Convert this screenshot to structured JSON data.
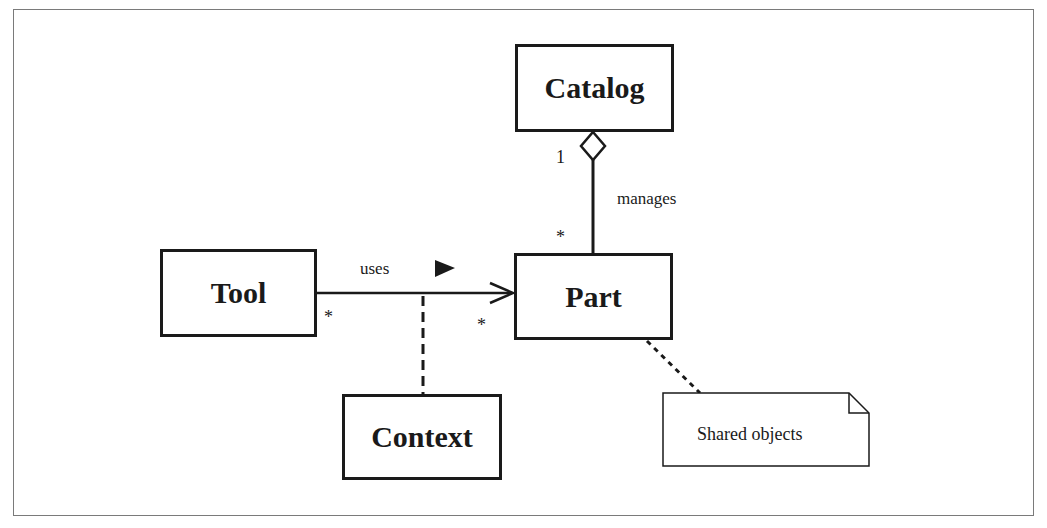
{
  "diagram": {
    "type": "UML class diagram",
    "classes": [
      {
        "id": "catalog",
        "name": "Catalog"
      },
      {
        "id": "tool",
        "name": "Tool"
      },
      {
        "id": "part",
        "name": "Part"
      },
      {
        "id": "context",
        "name": "Context"
      }
    ],
    "relationships": [
      {
        "id": "manages",
        "type": "aggregation",
        "from": "catalog",
        "to": "part",
        "label": "manages",
        "from_multiplicity": "1",
        "to_multiplicity": "*"
      },
      {
        "id": "uses",
        "type": "directed-association",
        "from": "tool",
        "to": "part",
        "label": "uses",
        "direction_marker": "▶",
        "from_multiplicity": "*",
        "to_multiplicity": "*",
        "association_class": "context"
      }
    ],
    "notes": [
      {
        "id": "shared-note",
        "text": "Shared objects",
        "attached_to": "part"
      }
    ],
    "colors": {
      "line": "#1a1a1a",
      "frame": "#7a7a7a",
      "background": "#ffffff"
    }
  }
}
